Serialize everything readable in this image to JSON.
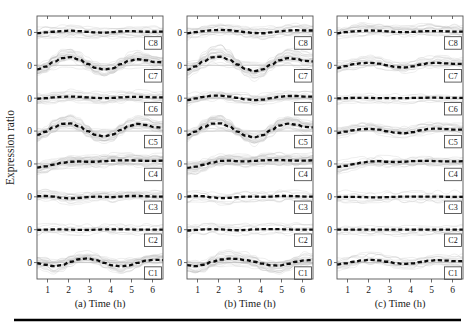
{
  "figure": {
    "ylabel": "Expression ratio",
    "zero_tick": "0",
    "panels": [
      {
        "id": "a",
        "caption": "(a) Time (h)",
        "xticks": [
          "1",
          "2",
          "3",
          "4",
          "5",
          "6"
        ],
        "clusters": [
          "C1",
          "C2",
          "C3",
          "C4",
          "C5",
          "C6",
          "C7",
          "C8"
        ]
      },
      {
        "id": "b",
        "caption": "(b) Time (h)",
        "xticks": [
          "1",
          "2",
          "3",
          "4",
          "5",
          "6"
        ],
        "clusters": [
          "C1",
          "C2",
          "C3",
          "C4",
          "C5",
          "C6",
          "C7",
          "C8"
        ]
      },
      {
        "id": "c",
        "caption": "(c) Time (h)",
        "xticks": [
          "1",
          "2",
          "3",
          "4",
          "5",
          "6"
        ],
        "clusters": [
          "C1",
          "C2",
          "C3",
          "C4",
          "C5",
          "C6",
          "C7",
          "C8"
        ]
      }
    ]
  },
  "chart_data": {
    "type": "line",
    "title": "",
    "xlabel": "Time (h)",
    "ylabel": "Expression ratio",
    "xlim": [
      0.5,
      6.5
    ],
    "xticks": [
      1,
      2,
      3,
      4,
      5,
      6
    ],
    "grid": false,
    "legend": "none",
    "subplot_layout": {
      "rows": 8,
      "cols": 3,
      "stacked_clusters_per_panel": 8
    },
    "x": [
      0.5,
      0.9,
      1.3,
      1.7,
      2.1,
      2.5,
      2.9,
      3.3,
      3.7,
      4.1,
      4.5,
      4.9,
      5.3,
      5.7,
      6.1,
      6.5
    ],
    "panels": [
      {
        "id": "a",
        "caption": "(a) Time (h)",
        "series": [
          {
            "name": "C8",
            "values": [
              -0.05,
              0.0,
              0.05,
              0.1,
              0.13,
              0.1,
              0.04,
              0.0,
              -0.02,
              0.02,
              0.08,
              0.1,
              0.08,
              0.05,
              0.05,
              0.06
            ]
          },
          {
            "name": "C7",
            "values": [
              -0.3,
              -0.1,
              0.25,
              0.52,
              0.6,
              0.42,
              0.1,
              -0.18,
              -0.3,
              -0.22,
              0.08,
              0.34,
              0.44,
              0.36,
              0.24,
              0.22
            ]
          },
          {
            "name": "C6",
            "values": [
              -0.04,
              0.0,
              0.06,
              0.1,
              0.12,
              0.1,
              0.06,
              0.02,
              0.0,
              0.02,
              0.06,
              0.1,
              0.1,
              0.08,
              0.06,
              0.06
            ]
          },
          {
            "name": "C5",
            "values": [
              -0.28,
              -0.05,
              0.28,
              0.52,
              0.55,
              0.34,
              0.0,
              -0.28,
              -0.38,
              -0.25,
              0.08,
              0.38,
              0.52,
              0.44,
              0.28,
              0.24
            ]
          },
          {
            "name": "C4",
            "values": [
              -0.26,
              -0.18,
              -0.05,
              0.08,
              0.16,
              0.18,
              0.16,
              0.16,
              0.2,
              0.24,
              0.26,
              0.26,
              0.24,
              0.22,
              0.22,
              0.24
            ]
          },
          {
            "name": "C3",
            "values": [
              0.04,
              0.06,
              0.02,
              -0.08,
              -0.12,
              -0.08,
              -0.02,
              0.02,
              0.0,
              -0.02,
              0.02,
              0.06,
              0.06,
              0.04,
              0.02,
              0.02
            ]
          },
          {
            "name": "C2",
            "values": [
              -0.02,
              0.0,
              0.02,
              0.02,
              0.0,
              -0.02,
              -0.02,
              0.0,
              0.02,
              0.02,
              0.02,
              0.02,
              0.0,
              0.0,
              0.0,
              0.0
            ]
          },
          {
            "name": "C1",
            "values": [
              -0.05,
              -0.16,
              -0.26,
              -0.18,
              0.06,
              0.24,
              0.3,
              0.18,
              -0.02,
              -0.2,
              -0.28,
              -0.2,
              -0.02,
              0.14,
              0.2,
              0.18
            ]
          }
        ]
      },
      {
        "id": "b",
        "caption": "(b) Time (h)",
        "series": [
          {
            "name": "C8",
            "values": [
              -0.06,
              0.02,
              0.1,
              0.16,
              0.18,
              0.16,
              0.1,
              0.02,
              -0.04,
              -0.06,
              0.0,
              0.08,
              0.14,
              0.16,
              0.14,
              0.14
            ]
          },
          {
            "name": "C7",
            "values": [
              -0.32,
              -0.08,
              0.3,
              0.58,
              0.62,
              0.42,
              0.06,
              -0.26,
              -0.42,
              -0.3,
              0.04,
              0.36,
              0.52,
              0.46,
              0.32,
              0.28
            ]
          },
          {
            "name": "C6",
            "values": [
              -0.14,
              -0.02,
              0.1,
              0.18,
              0.18,
              0.12,
              0.02,
              -0.08,
              -0.14,
              -0.1,
              0.0,
              0.1,
              0.16,
              0.16,
              0.12,
              0.12
            ]
          },
          {
            "name": "C5",
            "values": [
              -0.3,
              -0.04,
              0.3,
              0.54,
              0.56,
              0.34,
              -0.04,
              -0.34,
              -0.46,
              -0.3,
              0.06,
              0.4,
              0.54,
              0.46,
              0.3,
              0.26
            ]
          },
          {
            "name": "C4",
            "values": [
              -0.28,
              -0.2,
              -0.06,
              0.1,
              0.22,
              0.24,
              0.2,
              0.18,
              0.22,
              0.26,
              0.28,
              0.28,
              0.26,
              0.24,
              0.24,
              0.26
            ]
          },
          {
            "name": "C3",
            "values": [
              0.02,
              0.06,
              0.04,
              -0.04,
              -0.1,
              -0.08,
              -0.02,
              0.02,
              0.02,
              0.0,
              0.02,
              0.06,
              0.06,
              0.04,
              0.02,
              0.02
            ]
          },
          {
            "name": "C2",
            "values": [
              -0.06,
              -0.02,
              0.02,
              0.04,
              0.02,
              -0.02,
              -0.04,
              -0.02,
              0.02,
              0.04,
              0.04,
              0.04,
              0.02,
              0.0,
              0.0,
              0.0
            ]
          },
          {
            "name": "C1",
            "values": [
              -0.18,
              -0.26,
              -0.16,
              0.06,
              0.22,
              0.28,
              0.26,
              0.18,
              0.06,
              -0.08,
              -0.2,
              -0.22,
              -0.1,
              0.06,
              0.16,
              0.18
            ]
          }
        ]
      },
      {
        "id": "c",
        "caption": "(c) Time (h)",
        "series": [
          {
            "name": "C8",
            "values": [
              -0.06,
              0.02,
              0.08,
              0.12,
              0.14,
              0.12,
              0.08,
              0.04,
              0.02,
              0.04,
              0.08,
              0.1,
              0.1,
              0.08,
              0.06,
              0.06
            ]
          },
          {
            "name": "C7",
            "values": [
              -0.2,
              -0.06,
              0.08,
              0.16,
              0.18,
              0.12,
              0.0,
              -0.12,
              -0.16,
              -0.08,
              0.06,
              0.16,
              0.18,
              0.14,
              0.1,
              0.1
            ]
          },
          {
            "name": "C6",
            "values": [
              -0.02,
              0.0,
              0.02,
              0.02,
              0.02,
              0.0,
              0.0,
              0.0,
              0.0,
              0.02,
              0.02,
              0.04,
              0.04,
              0.02,
              0.02,
              0.02
            ]
          },
          {
            "name": "C5",
            "values": [
              -0.14,
              -0.04,
              0.06,
              0.14,
              0.16,
              0.1,
              -0.02,
              -0.12,
              -0.16,
              -0.08,
              0.06,
              0.16,
              0.18,
              0.14,
              0.1,
              0.1
            ]
          },
          {
            "name": "C4",
            "values": [
              -0.22,
              -0.14,
              -0.02,
              0.1,
              0.18,
              0.2,
              0.16,
              0.14,
              0.16,
              0.2,
              0.22,
              0.22,
              0.2,
              0.18,
              0.18,
              0.2
            ]
          },
          {
            "name": "C3",
            "values": [
              -0.02,
              0.0,
              0.0,
              -0.02,
              -0.04,
              -0.04,
              -0.02,
              0.0,
              0.02,
              0.02,
              0.02,
              0.02,
              0.02,
              0.0,
              0.0,
              0.0
            ]
          },
          {
            "name": "C2",
            "values": [
              0.0,
              0.0,
              0.0,
              0.0,
              0.0,
              0.0,
              0.0,
              0.0,
              0.0,
              0.0,
              0.0,
              0.0,
              0.0,
              0.0,
              0.0,
              0.0
            ]
          },
          {
            "name": "C1",
            "values": [
              -0.14,
              -0.06,
              0.06,
              0.16,
              0.2,
              0.16,
              0.06,
              -0.04,
              -0.1,
              -0.06,
              0.04,
              0.14,
              0.18,
              0.14,
              0.1,
              0.1
            ]
          }
        ]
      }
    ]
  }
}
